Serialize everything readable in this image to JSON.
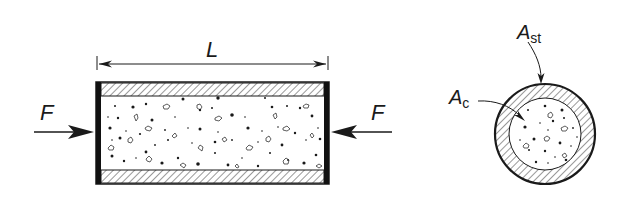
{
  "diagram": {
    "side_view": {
      "length_label": "L",
      "force_left_label": "F",
      "force_right_label": "F"
    },
    "cross_section": {
      "steel_area_label_main": "A",
      "steel_area_label_sub": "st",
      "concrete_area_label_main": "A",
      "concrete_area_label_sub": "c"
    },
    "colors": {
      "ink": "#1a1a1a",
      "background": "#ffffff"
    }
  }
}
